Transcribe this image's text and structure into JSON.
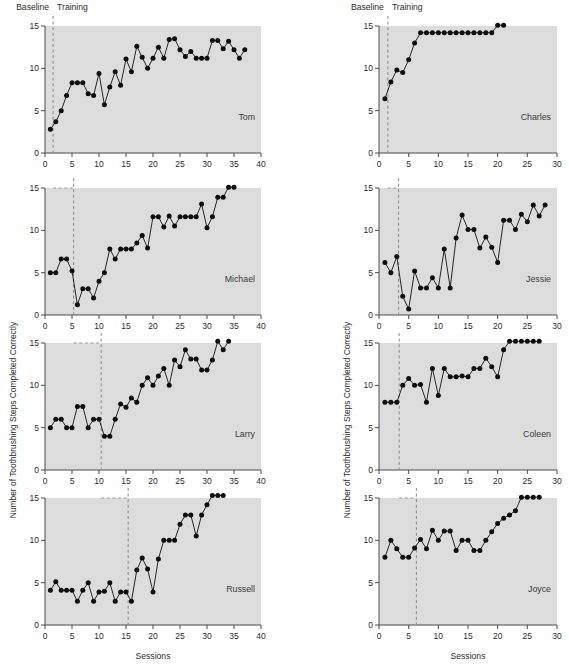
{
  "figure": {
    "phase_labels": {
      "baseline": "Baseline",
      "training": "Training"
    },
    "x_axis_title": "Sessions",
    "y_axis_title": "Number of Toothbrushing Steps Completed Correctly"
  },
  "chart_data": {
    "type": "line",
    "title": "",
    "xlabel": "Sessions",
    "ylabel": "Number of Toothbrushing Steps Completed Correctly",
    "ylim": [
      0,
      15
    ],
    "yticks": [
      0,
      5,
      10,
      15
    ],
    "grid": false,
    "legend": "none",
    "design": "multiple-baseline across participants",
    "phase_names": [
      "Baseline",
      "Training"
    ],
    "panels": [
      {
        "name": "Tom",
        "column": "left",
        "row": 1,
        "xlim": [
          0,
          40
        ],
        "xticks": [
          0,
          5,
          10,
          15,
          20,
          25,
          30,
          35,
          40
        ],
        "phase_change_x": 1.5,
        "x": [
          1,
          2,
          3,
          4,
          5,
          6,
          7,
          8,
          9,
          10,
          11,
          12,
          13,
          14,
          15,
          16,
          17,
          18,
          19,
          20,
          21,
          22,
          23,
          24,
          25,
          26,
          27,
          28,
          29,
          30,
          31,
          32,
          33,
          34,
          35,
          36,
          37
        ],
        "values": [
          2.8,
          3.7,
          5,
          6.8,
          8.3,
          8.3,
          8.3,
          7,
          6.8,
          9.4,
          5.7,
          7.8,
          9.6,
          8,
          11.1,
          9.6,
          12.6,
          11.3,
          10,
          11.2,
          12.5,
          11.2,
          13.4,
          13.5,
          12.2,
          11.4,
          12,
          11.2,
          11.2,
          11.2,
          13.3,
          13.3,
          12.3,
          13.2,
          12.2,
          11.2,
          12.2
        ]
      },
      {
        "name": "Charles",
        "column": "right",
        "row": 1,
        "xlim": [
          0,
          30
        ],
        "xticks": [
          0,
          5,
          10,
          15,
          20,
          25,
          30
        ],
        "phase_change_x": 1.5,
        "x": [
          1,
          2,
          3,
          4,
          5,
          6,
          7,
          8,
          9,
          10,
          11,
          12,
          13,
          14,
          15,
          16,
          17,
          18,
          19,
          20,
          21
        ],
        "values": [
          6.4,
          8.4,
          9.8,
          9.5,
          11,
          13,
          14.2,
          14.2,
          14.2,
          14.2,
          14.2,
          14.2,
          14.2,
          14.2,
          14.2,
          14.2,
          14.2,
          14.2,
          14.2,
          15.1,
          15.1
        ]
      },
      {
        "name": "Michael",
        "column": "left",
        "row": 2,
        "xlim": [
          0,
          40
        ],
        "xticks": [
          0,
          5,
          10,
          15,
          20,
          25,
          30,
          35,
          40
        ],
        "phase_change_x": 5.3,
        "x": [
          1,
          2,
          3,
          4,
          5,
          6,
          7,
          8,
          9,
          10,
          11,
          12,
          13,
          14,
          15,
          16,
          17,
          18,
          19,
          20,
          21,
          22,
          23,
          24,
          25,
          26,
          27,
          28,
          29,
          30,
          31,
          32,
          33,
          34,
          35
        ],
        "values": [
          5,
          5,
          6.6,
          6.6,
          5.2,
          1.2,
          3.1,
          3.1,
          2,
          4,
          5,
          7.8,
          6.6,
          7.8,
          7.8,
          7.8,
          8.5,
          9.4,
          7.9,
          11.6,
          11.6,
          10.4,
          11.7,
          10.5,
          11.6,
          11.6,
          11.6,
          11.6,
          13.1,
          10.3,
          11.6,
          13.9,
          13.9,
          15.1,
          15.1
        ]
      },
      {
        "name": "Jessie",
        "column": "right",
        "row": 2,
        "xlim": [
          0,
          30
        ],
        "xticks": [
          0,
          5,
          10,
          15,
          20,
          25,
          30
        ],
        "phase_change_x": 3.3,
        "x": [
          1,
          2,
          3,
          4,
          5,
          6,
          7,
          8,
          9,
          10,
          11,
          12,
          13,
          14,
          15,
          16,
          17,
          18,
          19,
          20,
          21,
          22,
          23,
          24,
          25,
          26,
          27,
          28
        ],
        "values": [
          6.2,
          5,
          6.9,
          2.2,
          0.7,
          5.2,
          3.2,
          3.2,
          4.4,
          3.2,
          7.8,
          3.2,
          9.1,
          11.8,
          10.1,
          10.1,
          7.9,
          9.2,
          8,
          6.2,
          11.2,
          11.2,
          10.1,
          11.9,
          11,
          13,
          11.7,
          13
        ]
      },
      {
        "name": "Larry",
        "column": "left",
        "row": 3,
        "xlim": [
          0,
          40
        ],
        "xticks": [
          0,
          5,
          10,
          15,
          20,
          25,
          30,
          35,
          40
        ],
        "phase_change_x": 10.4,
        "x": [
          1,
          2,
          3,
          4,
          5,
          6,
          7,
          8,
          9,
          10,
          11,
          12,
          13,
          14,
          15,
          16,
          17,
          18,
          19,
          20,
          21,
          22,
          23,
          24,
          25,
          26,
          27,
          28,
          29,
          30,
          31,
          32,
          33,
          34
        ],
        "values": [
          5,
          6,
          6,
          5,
          5,
          7.5,
          7.5,
          5,
          6,
          6,
          4,
          4,
          6,
          7.8,
          7.4,
          8.5,
          8,
          10,
          10.9,
          10,
          11.1,
          12,
          10,
          13,
          12.2,
          14.2,
          13.1,
          13.1,
          11.8,
          11.8,
          13,
          15.2,
          14.2,
          15.2
        ]
      },
      {
        "name": "Coleen",
        "column": "right",
        "row": 3,
        "xlim": [
          0,
          30
        ],
        "xticks": [
          0,
          5,
          10,
          15,
          20,
          25,
          30
        ],
        "phase_change_x": 3.4,
        "x": [
          1,
          2,
          3,
          4,
          5,
          6,
          7,
          8,
          9,
          10,
          11,
          12,
          13,
          14,
          15,
          16,
          17,
          18,
          19,
          20,
          21,
          22,
          23,
          24,
          25,
          26,
          27
        ],
        "values": [
          8,
          8,
          8,
          10,
          10.8,
          10,
          10.1,
          8,
          12,
          8.8,
          12,
          11,
          11,
          11.1,
          11,
          12,
          12,
          13.2,
          12.2,
          11,
          14.2,
          15.2,
          15.2,
          15.2,
          15.2,
          15.2,
          15.2
        ]
      },
      {
        "name": "Russell",
        "column": "left",
        "row": 4,
        "xlim": [
          0,
          40
        ],
        "xticks": [
          0,
          5,
          10,
          15,
          20,
          25,
          30,
          35,
          40
        ],
        "phase_change_x": 15.4,
        "x": [
          1,
          2,
          3,
          4,
          5,
          6,
          7,
          8,
          9,
          10,
          11,
          12,
          13,
          14,
          15,
          16,
          17,
          18,
          19,
          20,
          21,
          22,
          23,
          24,
          25,
          26,
          27,
          28,
          29,
          30,
          31,
          32,
          33
        ],
        "values": [
          4.1,
          5.1,
          4.1,
          4.1,
          4.1,
          2.8,
          4.1,
          5,
          2.8,
          3.9,
          4,
          5,
          2.8,
          3.9,
          3.9,
          2.8,
          6.5,
          7.9,
          6.6,
          3.9,
          7.8,
          10,
          10,
          10,
          11.9,
          13,
          13,
          10.5,
          13,
          14.2,
          15.3,
          15.3,
          15.3
        ]
      },
      {
        "name": "Joyce",
        "column": "right",
        "row": 4,
        "xlim": [
          0,
          30
        ],
        "xticks": [
          0,
          5,
          10,
          15,
          20,
          25,
          30
        ],
        "phase_change_x": 6.3,
        "x": [
          1,
          2,
          3,
          4,
          5,
          6,
          7,
          8,
          9,
          10,
          11,
          12,
          13,
          14,
          15,
          16,
          17,
          18,
          19,
          20,
          21,
          22,
          23,
          24,
          25,
          26,
          27
        ],
        "values": [
          8,
          10,
          9,
          8,
          8,
          9.1,
          10.1,
          9,
          11.2,
          10,
          11.1,
          11.1,
          8.8,
          10,
          10,
          8.8,
          8.8,
          10,
          11,
          12,
          12.6,
          13,
          13.5,
          15.1,
          15.1,
          15.1,
          15.1
        ]
      }
    ]
  }
}
